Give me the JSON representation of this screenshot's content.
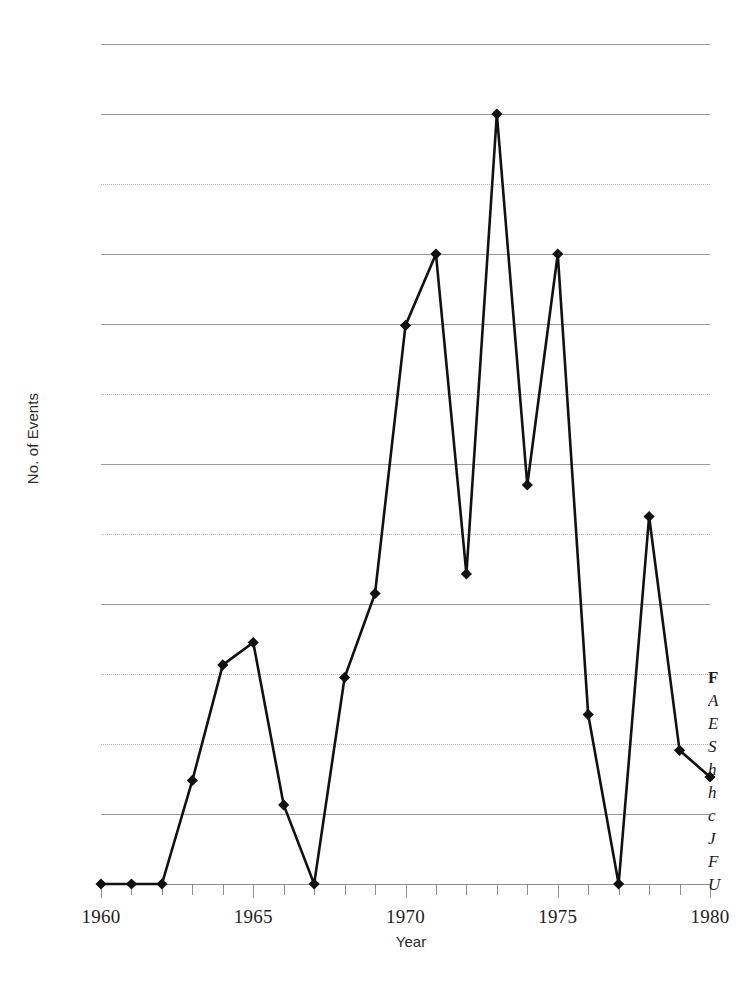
{
  "figure": {
    "background_color": "#ffffff",
    "line_color": "#111111",
    "gridline_color": "#9a9a9a",
    "axis_color": "#8e8e8e"
  },
  "axes": {
    "y_title": "No. of Events",
    "x_title": "Year"
  },
  "caption": {
    "lines": [
      {
        "text": "F",
        "style": "bold"
      },
      {
        "text": "A",
        "style": "italic"
      },
      {
        "text": "E",
        "style": "italic"
      },
      {
        "text": "S",
        "style": "italic"
      },
      {
        "text": "h",
        "style": "italic"
      },
      {
        "text": "h",
        "style": "italic"
      },
      {
        "text": "c",
        "style": "italic"
      },
      {
        "text": "J",
        "style": "italic"
      },
      {
        "text": "F",
        "style": "italic"
      },
      {
        "text": "U",
        "style": "italic"
      }
    ]
  },
  "chart_data": {
    "type": "line",
    "title": "",
    "subtitle": "",
    "xlabel": "Year",
    "ylabel": "No. of Events",
    "xlim": [
      1960,
      1980
    ],
    "ylim": [
      0,
      120
    ],
    "grid": true,
    "legend": false,
    "marker": "diamond",
    "y_ticks": [
      0,
      10,
      20,
      30,
      40,
      50,
      60,
      70,
      80,
      90,
      100,
      110,
      120
    ],
    "y_tick_labels": [
      "0",
      "10",
      "20",
      "30",
      "40",
      "50",
      "60",
      "70",
      "80",
      "90",
      "100",
      "110",
      "120"
    ],
    "x_ticks": [
      1960,
      1961,
      1962,
      1963,
      1964,
      1965,
      1966,
      1967,
      1968,
      1969,
      1970,
      1971,
      1972,
      1973,
      1974,
      1975,
      1976,
      1977,
      1978,
      1979,
      1980
    ],
    "x_tick_labels_shown": [
      "1960",
      "1965",
      "1970",
      "1975",
      "1980"
    ],
    "x": [
      1960,
      1961,
      1962,
      1963,
      1964,
      1965,
      1966,
      1967,
      1968,
      1969,
      1970,
      1971,
      1972,
      1973,
      1974,
      1975,
      1976,
      1977,
      1978,
      1979,
      1980
    ],
    "values": [
      0,
      0,
      0,
      14.8,
      31.3,
      34.5,
      11.3,
      0,
      29.5,
      41.5,
      79.8,
      90,
      44.3,
      110,
      57,
      90,
      24.2,
      0,
      52.5,
      19.1,
      15.3
    ]
  }
}
